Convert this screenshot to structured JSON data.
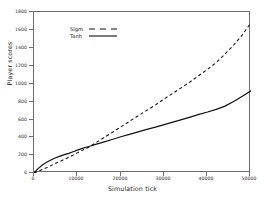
{
  "chart_data": {
    "type": "line",
    "title": "",
    "xlabel": "Simulation tick",
    "ylabel": "Player scores",
    "xlim": [
      0,
      50000
    ],
    "ylim": [
      0,
      1800
    ],
    "xticks": [
      0,
      10000,
      20000,
      30000,
      40000,
      50000
    ],
    "xticklabels": [
      "0",
      "10000",
      "20000",
      "30000",
      "40000",
      "50000"
    ],
    "yticks": [
      0,
      200,
      400,
      600,
      800,
      1000,
      1200,
      1400,
      1600,
      1800
    ],
    "yticklabels": [
      "0",
      "200",
      "400",
      "600",
      "800",
      "1000",
      "1200",
      "1400",
      "1600",
      "1800"
    ],
    "grid": false,
    "legend_position": "upper left",
    "legend_entries": [
      "Sigm",
      "Tanh"
    ],
    "x": [
      0,
      1000,
      2000,
      3000,
      4000,
      5000,
      6000,
      7000,
      8000,
      9000,
      10000,
      11000,
      12000,
      13000,
      14000,
      15000,
      16000,
      18000,
      20000,
      22000,
      24000,
      26000,
      28000,
      30000,
      32000,
      34000,
      36000,
      38000,
      40000,
      42000,
      44000,
      46000,
      48000,
      50000
    ],
    "series": [
      {
        "name": "Sigm",
        "linestyle": "dashed",
        "color": "#111111",
        "values": [
          0,
          20,
          42,
          62,
          85,
          108,
          130,
          152,
          176,
          200,
          225,
          250,
          272,
          300,
          330,
          362,
          392,
          452,
          515,
          578,
          640,
          700,
          762,
          828,
          892,
          955,
          1020,
          1090,
          1160,
          1235,
          1330,
          1430,
          1545,
          1680
        ]
      },
      {
        "name": "Tanh",
        "linestyle": "solid",
        "color": "#111111",
        "values": [
          0,
          52,
          92,
          122,
          148,
          170,
          188,
          205,
          220,
          238,
          255,
          272,
          288,
          302,
          318,
          332,
          346,
          375,
          405,
          432,
          460,
          488,
          512,
          540,
          568,
          596,
          625,
          655,
          682,
          712,
          748,
          800,
          858,
          920
        ]
      }
    ]
  }
}
